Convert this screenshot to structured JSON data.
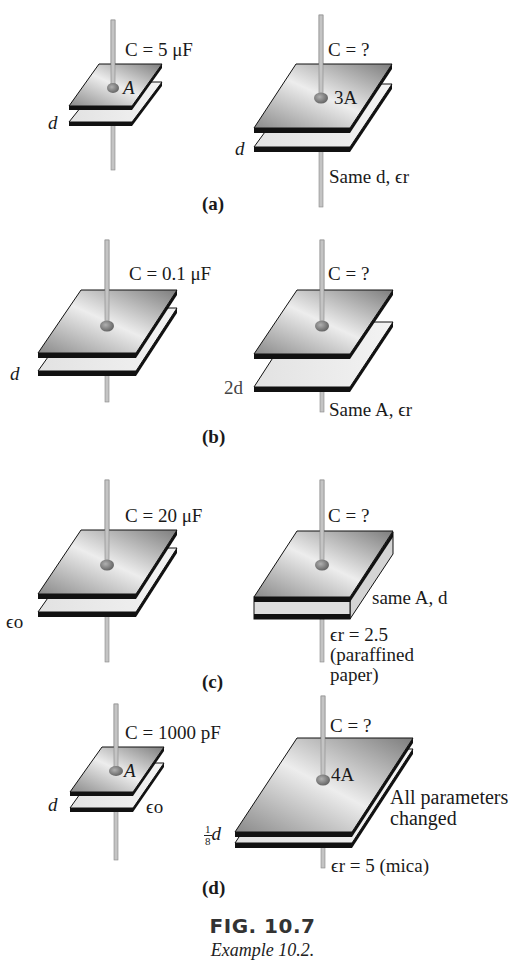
{
  "figure": {
    "title": "FIG. 10.7",
    "subtitle": "Example 10.2."
  },
  "panels": [
    {
      "label": "(a)",
      "given": {
        "capacitance": "C = 5 μF",
        "area": "A",
        "distance": "d"
      },
      "unknown": {
        "capacitance": "C = ?",
        "area": "3A",
        "distance": "d",
        "note": "Same d, ϵr"
      }
    },
    {
      "label": "(b)",
      "given": {
        "capacitance": "C = 0.1 μF",
        "distance": "d"
      },
      "unknown": {
        "capacitance": "C = ?",
        "distance": "2d",
        "note": "Same A, ϵr"
      }
    },
    {
      "label": "(c)",
      "given": {
        "capacitance": "C = 20 μF",
        "permittivity": "ϵo"
      },
      "unknown": {
        "capacitance": "C = ?",
        "note": "same A, d",
        "dielectric": "ϵr = 2.5",
        "material_line1": "(paraffined",
        "material_line2": "paper)"
      }
    },
    {
      "label": "(d)",
      "given": {
        "capacitance": "C = 1000 pF",
        "area": "A",
        "distance": "d",
        "permittivity": "ϵo"
      },
      "unknown": {
        "capacitance": "C = ?",
        "area": "4A",
        "distance_fraction_num": "1",
        "distance_fraction_den": "8",
        "distance": "d",
        "note_line1": "All parameters",
        "note_line2": "changed",
        "dielectric": "ϵr = 5 (mica)"
      }
    }
  ],
  "colors": {
    "plate_top_dark": "#8f8f8f",
    "plate_top_light": "#ececec",
    "plate_lower": "#e6e6e6",
    "edge": "#111111",
    "wire": "#b8b8b8"
  }
}
